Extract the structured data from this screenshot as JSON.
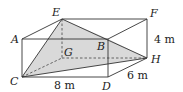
{
  "figure": {
    "type": "rectangular prism (cuboid) with shaded pyramid",
    "vertices": {
      "A": "A",
      "B": "B",
      "C": "C",
      "D": "D",
      "E": "E",
      "F": "F",
      "G": "G",
      "H": "H"
    },
    "dimensions": {
      "length": "8 m",
      "width": "6 m",
      "height": "4 m"
    },
    "shaded_region": "pyramid E-CGH-B (triangular faces from apex E to base C, H)",
    "colors": {
      "line": "#333333",
      "shade": "#d9d9d9",
      "hidden_line": "#555555"
    }
  }
}
